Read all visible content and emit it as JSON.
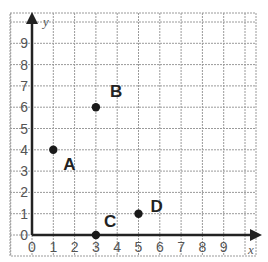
{
  "chart_data": {
    "type": "scatter",
    "title": "",
    "xlabel": "x",
    "ylabel": "y",
    "xlim": [
      0,
      10
    ],
    "ylim": [
      0,
      10
    ],
    "grid": true,
    "x_ticks": [
      "0",
      "1",
      "2",
      "3",
      "4",
      "5",
      "6",
      "7",
      "8",
      "9"
    ],
    "y_ticks": [
      "0",
      "1",
      "2",
      "3",
      "4",
      "5",
      "6",
      "7",
      "8",
      "9"
    ],
    "points": [
      {
        "label": "A",
        "x": 1,
        "y": 4
      },
      {
        "label": "B",
        "x": 3,
        "y": 6
      },
      {
        "label": "C",
        "x": 3,
        "y": 0
      },
      {
        "label": "D",
        "x": 5,
        "y": 1
      }
    ]
  },
  "colors": {
    "grid": "#9a9a9a",
    "axis": "#222222",
    "point": "#1a1a1a"
  }
}
